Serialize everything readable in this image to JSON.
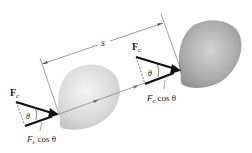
{
  "figure": {
    "displacement_label": "s",
    "force_label": "F",
    "force_subscript": "c",
    "angle_label": "θ",
    "component_label_main": "F",
    "component_label_sub": "c",
    "component_label_rest": " cos θ",
    "colors": {
      "force_arrow": "#111111",
      "path_line": "#8a8a8a",
      "dimension_line": "#555555",
      "blob_start": "#d8d8d8",
      "blob_end": "#a9a9a9"
    }
  },
  "positions": [
    {
      "name": "initial-position",
      "force_label": "F",
      "force_subscript": "c",
      "angle": "θ",
      "component": "F c cos θ"
    },
    {
      "name": "final-position",
      "force_label": "F",
      "force_subscript": "c",
      "angle": "θ",
      "component": "F c cos θ"
    }
  ]
}
